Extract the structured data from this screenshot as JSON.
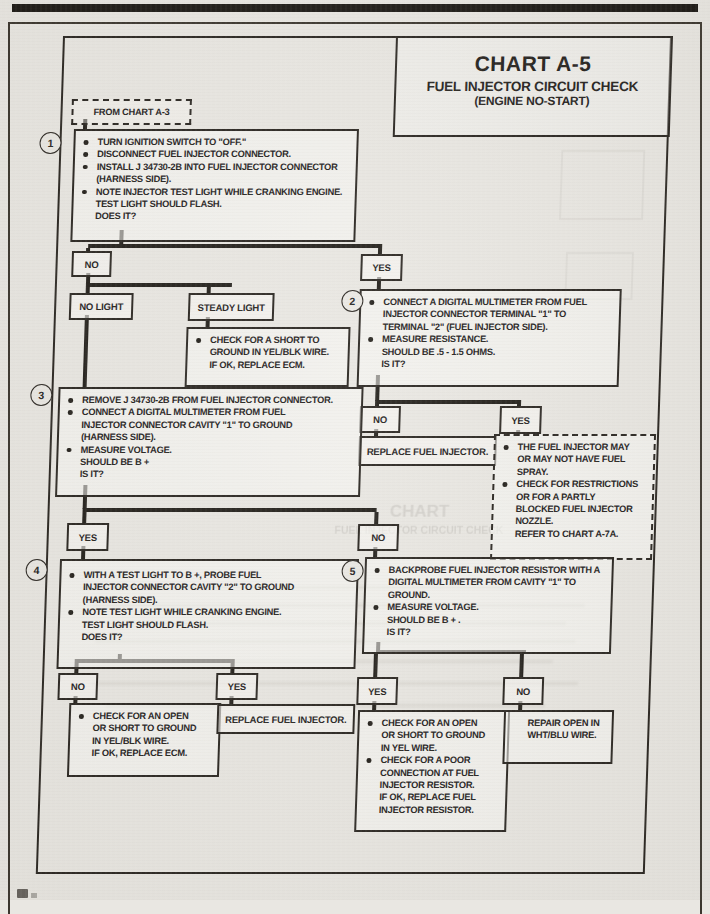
{
  "page": {
    "title": {
      "chart": "CHART A-5",
      "line1": "FUEL INJECTOR CIRCUIT CHECK",
      "line2": "(ENGINE NO-START)"
    },
    "entry_label": "FROM CHART A-3",
    "ink_color": "#26231e",
    "paper_color": "#e9e7e2"
  },
  "flow": {
    "step1": {
      "num": "1",
      "lines": [
        {
          "b": 1,
          "t": "TURN IGNITION SWITCH TO \"OFF.\""
        },
        {
          "b": 1,
          "t": "DISCONNECT FUEL INJECTOR CONNECTOR."
        },
        {
          "b": 1,
          "t": "INSTALL J 34730-2B INTO FUEL INJECTOR CONNECTOR"
        },
        {
          "b": 0,
          "t": "(HARNESS SIDE)."
        },
        {
          "b": 1,
          "t": "NOTE INJECTOR TEST LIGHT WHILE CRANKING ENGINE."
        },
        {
          "b": 0,
          "t": "TEST LIGHT SHOULD FLASH."
        },
        {
          "b": 0,
          "t": "DOES IT?"
        }
      ]
    },
    "d1_no": "NO",
    "d1_yes": "YES",
    "light_no": "NO LIGHT",
    "light_steady": "STEADY LIGHT",
    "steady_result": {
      "lines": [
        {
          "b": 1,
          "t": "CHECK FOR A SHORT TO"
        },
        {
          "b": 0,
          "t": "GROUND IN YEL/BLK WIRE."
        },
        {
          "b": 0,
          "t": "IF OK, REPLACE ECM."
        }
      ]
    },
    "step2": {
      "num": "2",
      "lines": [
        {
          "b": 1,
          "t": "CONNECT A DIGITAL MULTIMETER FROM FUEL"
        },
        {
          "b": 0,
          "t": "INJECTOR CONNECTOR TERMINAL \"1\" TO"
        },
        {
          "b": 0,
          "t": "TERMINAL \"2\" (FUEL INJECTOR SIDE)."
        },
        {
          "b": 1,
          "t": "MEASURE RESISTANCE."
        },
        {
          "b": 0,
          "t": "SHOULD BE .5 - 1.5 OHMS."
        },
        {
          "b": 0,
          "t": "IS IT?"
        }
      ]
    },
    "d2_no": "NO",
    "d2_yes": "YES",
    "replace_injector_1": "REPLACE FUEL INJECTOR.",
    "spray_note": {
      "lines": [
        {
          "b": 1,
          "t": "THE FUEL INJECTOR MAY"
        },
        {
          "b": 0,
          "t": "OR MAY NOT HAVE FUEL"
        },
        {
          "b": 0,
          "t": "SPRAY."
        },
        {
          "b": 1,
          "t": "CHECK FOR RESTRICTIONS"
        },
        {
          "b": 0,
          "t": "OR FOR A PARTLY"
        },
        {
          "b": 0,
          "t": "BLOCKED FUEL INJECTOR"
        },
        {
          "b": 0,
          "t": "NOZZLE."
        },
        {
          "b": 0,
          "t": "REFER TO CHART A-7A."
        }
      ]
    },
    "step3": {
      "num": "3",
      "lines": [
        {
          "b": 1,
          "t": "REMOVE J 34730-2B FROM FUEL INJECTOR CONNECTOR."
        },
        {
          "b": 1,
          "t": "CONNECT A DIGITAL MULTIMETER FROM FUEL"
        },
        {
          "b": 0,
          "t": "INJECTOR CONNECTOR CAVITY \"1\" TO GROUND"
        },
        {
          "b": 0,
          "t": "(HARNESS SIDE)."
        },
        {
          "b": 1,
          "t": "MEASURE VOLTAGE."
        },
        {
          "b": 0,
          "t": "SHOULD BE B +"
        },
        {
          "b": 0,
          "t": "IS IT?"
        }
      ]
    },
    "d3_yes": "YES",
    "d3_no": "NO",
    "step4": {
      "num": "4",
      "lines": [
        {
          "b": 1,
          "t": "WITH A TEST LIGHT TO B +, PROBE FUEL"
        },
        {
          "b": 0,
          "t": "INJECTOR CONNECTOR CAVITY \"2\" TO GROUND"
        },
        {
          "b": 0,
          "t": "(HARNESS SIDE)."
        },
        {
          "b": 1,
          "t": "NOTE TEST LIGHT WHILE CRANKING ENGINE."
        },
        {
          "b": 0,
          "t": "TEST LIGHT SHOULD FLASH."
        },
        {
          "b": 0,
          "t": "DOES IT?"
        }
      ]
    },
    "step5": {
      "num": "5",
      "lines": [
        {
          "b": 1,
          "t": "BACKPROBE FUEL INJECTOR RESISTOR WITH A"
        },
        {
          "b": 0,
          "t": "DIGITAL MULTIMETER FROM CAVITY \"1\" TO"
        },
        {
          "b": 0,
          "t": "GROUND."
        },
        {
          "b": 1,
          "t": "MEASURE VOLTAGE."
        },
        {
          "b": 0,
          "t": "SHOULD BE B + ."
        },
        {
          "b": 0,
          "t": "IS IT?"
        }
      ]
    },
    "d4_no": "NO",
    "d4_yes": "YES",
    "open_yelblk": {
      "lines": [
        {
          "b": 1,
          "t": "CHECK FOR AN OPEN"
        },
        {
          "b": 0,
          "t": "OR SHORT TO GROUND"
        },
        {
          "b": 0,
          "t": "IN YEL/BLK WIRE."
        },
        {
          "b": 0,
          "t": "IF OK, REPLACE ECM."
        }
      ]
    },
    "replace_injector_2": "REPLACE FUEL INJECTOR.",
    "d5_yes": "YES",
    "d5_no": "NO",
    "open_yel": {
      "lines": [
        {
          "b": 1,
          "t": "CHECK FOR AN OPEN"
        },
        {
          "b": 0,
          "t": "OR SHORT TO GROUND"
        },
        {
          "b": 0,
          "t": "IN YEL WIRE."
        },
        {
          "b": 1,
          "t": "CHECK FOR A POOR"
        },
        {
          "b": 0,
          "t": "CONNECTION AT FUEL"
        },
        {
          "b": 0,
          "t": "INJECTOR RESISTOR."
        },
        {
          "b": 0,
          "t": "IF OK, REPLACE FUEL"
        },
        {
          "b": 0,
          "t": "INJECTOR RESISTOR."
        }
      ]
    },
    "repair_whtblu": {
      "lines": [
        {
          "b": 0,
          "t": "REPAIR OPEN IN"
        },
        {
          "b": 0,
          "t": "WHT/BLU WIRE."
        }
      ]
    }
  },
  "bleed_through": {
    "line1": "CHART",
    "line2": "FUEL INJECTOR CIRCUIT CHECK"
  }
}
